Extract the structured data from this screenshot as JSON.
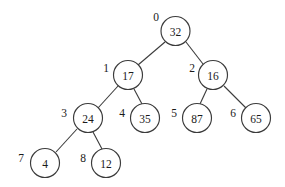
{
  "figure": {
    "background_color": "#ffffff",
    "stroke_color": "#3b3b3b",
    "text_color": "#1a1a1a",
    "node_radius": 14.5
  },
  "chart_data": {
    "type": "diagram",
    "title": "",
    "xlabel": "",
    "ylabel": "",
    "nodes": [
      {
        "index": "0",
        "value": "32",
        "cx": 175.5,
        "cy": 31,
        "label_x": 156,
        "label_y": 17
      },
      {
        "index": "1",
        "value": "17",
        "cx": 128,
        "cy": 75,
        "label_x": 106,
        "label_y": 68
      },
      {
        "index": "2",
        "value": "16",
        "cx": 213,
        "cy": 75,
        "label_x": 192,
        "label_y": 68
      },
      {
        "index": "3",
        "value": "24",
        "cx": 88,
        "cy": 118,
        "label_x": 64,
        "label_y": 113
      },
      {
        "index": "4",
        "value": "35",
        "cx": 145,
        "cy": 118,
        "label_x": 122,
        "label_y": 113
      },
      {
        "index": "5",
        "value": "87",
        "cx": 197,
        "cy": 118,
        "label_x": 174,
        "label_y": 113
      },
      {
        "index": "6",
        "value": "65",
        "cx": 256,
        "cy": 118,
        "label_x": 233,
        "label_y": 113
      },
      {
        "index": "7",
        "value": "4",
        "cx": 45,
        "cy": 163,
        "label_x": 21,
        "label_y": 158
      },
      {
        "index": "8",
        "value": "12",
        "cx": 106,
        "cy": 163,
        "label_x": 83,
        "label_y": 158
      }
    ],
    "edges": [
      {
        "from": "0",
        "to": "1",
        "x1": 165,
        "y1": 42,
        "x2": 138,
        "y2": 65
      },
      {
        "from": "0",
        "to": "2",
        "x1": 186,
        "y1": 42,
        "x2": 203,
        "y2": 64
      },
      {
        "from": "1",
        "to": "3",
        "x1": 118,
        "y1": 86,
        "x2": 98,
        "y2": 108
      },
      {
        "from": "1",
        "to": "4",
        "x1": 134,
        "y1": 89,
        "x2": 142,
        "y2": 104
      },
      {
        "from": "2",
        "to": "5",
        "x1": 207,
        "y1": 89,
        "x2": 200,
        "y2": 104
      },
      {
        "from": "2",
        "to": "6",
        "x1": 224,
        "y1": 86,
        "x2": 246,
        "y2": 108
      },
      {
        "from": "3",
        "to": "7",
        "x1": 77,
        "y1": 129,
        "x2": 56,
        "y2": 152
      },
      {
        "from": "3",
        "to": "8",
        "x1": 93,
        "y1": 132,
        "x2": 102,
        "y2": 149
      }
    ]
  }
}
